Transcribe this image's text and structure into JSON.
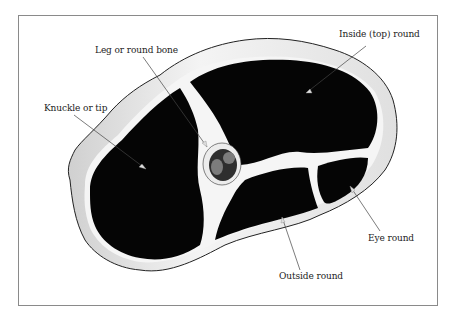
{
  "diagram": {
    "colors": {
      "muscle": "#050505",
      "fat": "#f2f2f2",
      "fat_shade": "#c8c8c8",
      "outline": "#222222",
      "bone_outer": "#e8e8e8",
      "marrow": "#3a3a3a",
      "marrow_lobe": "#7a7a7a",
      "frame": "#8a8a8a"
    },
    "labels": [
      {
        "id": "leg-bone",
        "text": "Leg or round bone"
      },
      {
        "id": "inside-round",
        "text": "Inside (top) round"
      },
      {
        "id": "knuckle",
        "text": "Knuckle or tip"
      },
      {
        "id": "eye-round",
        "text": "Eye round"
      },
      {
        "id": "outside-round",
        "text": "Outside round"
      }
    ]
  }
}
